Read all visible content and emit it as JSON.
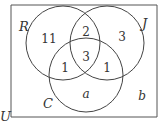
{
  "diagram": {
    "type": "venn-3-set",
    "universe_label": "U",
    "sets": [
      {
        "id": "R",
        "label": "R",
        "cx": 63,
        "cy": 43,
        "r": 37
      },
      {
        "id": "J",
        "label": "J",
        "cx": 107,
        "cy": 43,
        "r": 37
      },
      {
        "id": "C",
        "label": "C",
        "cx": 86,
        "cy": 75,
        "r": 37
      }
    ],
    "regions": {
      "R_only": "11",
      "R_and_J_only": "2",
      "J_only": "3",
      "R_J_C": "3",
      "R_and_C_only": "1",
      "J_and_C_only": "1",
      "C_only": "a",
      "outside": "b"
    },
    "colors": {
      "stroke": "#444444",
      "text": "#333333",
      "background": "#ffffff"
    }
  }
}
